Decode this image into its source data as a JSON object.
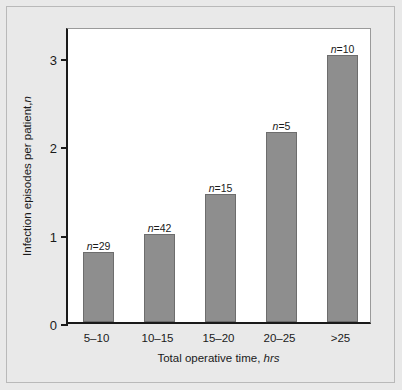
{
  "chart_data": {
    "type": "bar",
    "title": "",
    "subtitle": "",
    "xlabel": "Total operative time, hrs",
    "xlabel_plain": "Total operative time,",
    "xlabel_italic": "hrs",
    "ylabel": "Infection episodes per patient, n",
    "ylabel_plain": "Infection episodes per patient,",
    "ylabel_italic": "n",
    "categories": [
      "5–10",
      "10–15",
      "15–20",
      "20–25",
      ">25"
    ],
    "values": [
      0.79,
      1.0,
      1.45,
      2.15,
      3.02
    ],
    "point_labels": [
      "n=29",
      "n=42",
      "n=15",
      "n=5",
      "n=10"
    ],
    "point_label_values": [
      "29",
      "42",
      "15",
      "5",
      "10"
    ],
    "point_label_prefix": "n",
    "point_label_separator": "=",
    "ylim": [
      0,
      3.35
    ],
    "yticks": [
      0,
      1,
      2,
      3
    ],
    "ytick_labels": [
      "0",
      "1",
      "2",
      "3"
    ],
    "grid": false,
    "legend": false,
    "legend_position": "none",
    "bar_color": "#8e8e8e",
    "bar_edge_color": "#6d6d6d",
    "axis_color": "#1a1a1a",
    "plot_background": "#ffffff",
    "figure_background": "#e9e9e9",
    "frame_color": "#b9b9b9"
  }
}
